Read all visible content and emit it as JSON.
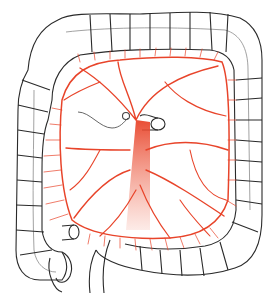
{
  "figure": {
    "colors": {
      "outline": "#2a2a2a",
      "artery": "#e8442a",
      "artery_light": "#f07a62",
      "background": "#ffffff",
      "shading": "#9a9a9a"
    },
    "labels": []
  }
}
